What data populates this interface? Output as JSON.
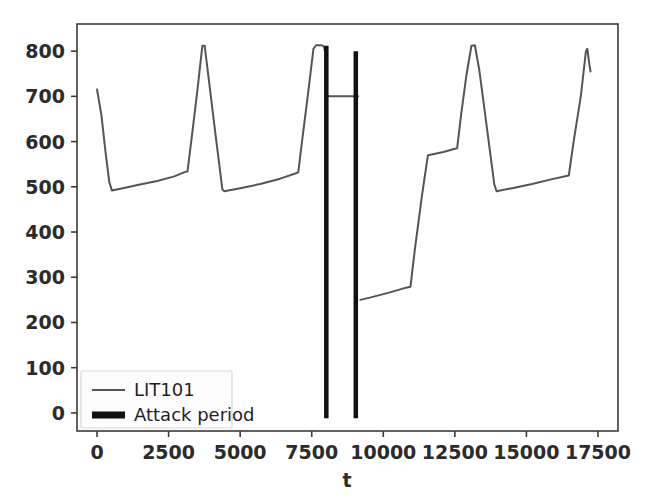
{
  "chart_data": {
    "type": "line",
    "title": "",
    "xlabel": "t",
    "ylabel": "",
    "xlim": [
      -700,
      18200
    ],
    "ylim": [
      -40,
      860
    ],
    "xticks": [
      0,
      2500,
      5000,
      7500,
      10000,
      12500,
      15000,
      17500
    ],
    "xticklabels": [
      "0",
      "2500",
      "5000",
      "7500",
      "10000",
      "12500",
      "15000",
      "17500"
    ],
    "yticks": [
      0,
      100,
      200,
      300,
      400,
      500,
      600,
      700,
      800
    ],
    "yticklabels": [
      "0",
      "100",
      "200",
      "300",
      "400",
      "500",
      "600",
      "700",
      "800"
    ],
    "grid": false,
    "legend_position": "lower left",
    "series": [
      {
        "name": "LIT101",
        "type": "line",
        "color": "#555555",
        "linewidth": 2.0,
        "points": [
          [
            0,
            715
          ],
          [
            150,
            660
          ],
          [
            300,
            575
          ],
          [
            430,
            510
          ],
          [
            520,
            492
          ],
          [
            900,
            497
          ],
          [
            1500,
            505
          ],
          [
            2100,
            513
          ],
          [
            2700,
            523
          ],
          [
            3080,
            533
          ],
          [
            3160,
            534
          ],
          [
            3300,
            605
          ],
          [
            3500,
            710
          ],
          [
            3680,
            812
          ],
          [
            3760,
            812
          ],
          [
            3900,
            740
          ],
          [
            4150,
            610
          ],
          [
            4380,
            494
          ],
          [
            4450,
            490
          ],
          [
            5000,
            497
          ],
          [
            5700,
            506
          ],
          [
            6400,
            518
          ],
          [
            6950,
            530
          ],
          [
            7030,
            532
          ],
          [
            7180,
            610
          ],
          [
            7380,
            710
          ],
          [
            7560,
            805
          ],
          [
            7650,
            813
          ],
          [
            7850,
            813
          ],
          [
            7930,
            810
          ],
          [
            7960,
            800
          ]
        ]
      },
      {
        "name": "LIT101-mid",
        "type": "line",
        "color": "#555555",
        "linewidth": 2.0,
        "points": [
          [
            7980,
            700
          ],
          [
            9120,
            700
          ]
        ]
      },
      {
        "name": "LIT101-right",
        "type": "line",
        "color": "#555555",
        "linewidth": 2.0,
        "points": [
          [
            9200,
            250
          ],
          [
            9600,
            256
          ],
          [
            10200,
            266
          ],
          [
            10800,
            277
          ],
          [
            10950,
            279
          ],
          [
            11100,
            360
          ],
          [
            11350,
            480
          ],
          [
            11560,
            570
          ],
          [
            11650,
            571
          ],
          [
            12100,
            577
          ],
          [
            12500,
            584
          ],
          [
            12580,
            585
          ],
          [
            12720,
            660
          ],
          [
            12900,
            745
          ],
          [
            13080,
            812
          ],
          [
            13200,
            813
          ],
          [
            13350,
            760
          ],
          [
            13600,
            640
          ],
          [
            13880,
            505
          ],
          [
            13960,
            490
          ],
          [
            14500,
            497
          ],
          [
            15200,
            506
          ],
          [
            15900,
            517
          ],
          [
            16400,
            524
          ],
          [
            16480,
            525
          ],
          [
            16650,
            600
          ],
          [
            16900,
            700
          ],
          [
            17080,
            800
          ],
          [
            17130,
            805
          ],
          [
            17200,
            770
          ],
          [
            17240,
            755
          ]
        ]
      }
    ],
    "attack_periods": [
      {
        "name": "Attack period",
        "t_start": 7960,
        "t_end": 8060,
        "y_top": 812,
        "y_bottom": -12
      },
      {
        "name": "Attack period",
        "t_start": 8990,
        "t_end": 9090,
        "y_top": 800,
        "y_bottom": -12
      }
    ],
    "attack_color": "#111111",
    "legend": [
      {
        "label": "LIT101",
        "color": "#555555",
        "linewidth": 2.0
      },
      {
        "label": "Attack period",
        "color": "#111111",
        "linewidth": 7.0
      }
    ]
  }
}
